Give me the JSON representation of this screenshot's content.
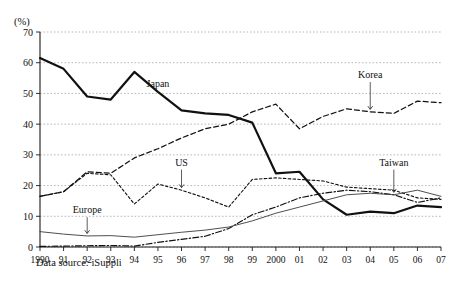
{
  "figure": {
    "unit_label": "(%)",
    "source_note": "Data source: iSuppli"
  },
  "chart_data": {
    "type": "line",
    "title": "",
    "xlabel": "",
    "ylabel": "(%)",
    "ylim": [
      0,
      70
    ],
    "yticks": [
      0,
      10,
      20,
      30,
      40,
      50,
      60,
      70
    ],
    "grid": true,
    "legend_position": "inline-annotations",
    "x": [
      1990,
      1991,
      1992,
      1993,
      1994,
      1995,
      1996,
      1997,
      1998,
      1999,
      2000,
      2001,
      2002,
      2003,
      2004,
      2005,
      2006,
      2007
    ],
    "categories": [
      "1990",
      "91",
      "92",
      "93",
      "94",
      "95",
      "96",
      "97",
      "98",
      "99",
      "2000",
      "01",
      "02",
      "03",
      "04",
      "05",
      "06",
      "07"
    ],
    "series": [
      {
        "name": "Japan",
        "style": "thick-solid",
        "values": [
          61.5,
          58.0,
          49.0,
          48.0,
          57.0,
          50.5,
          44.5,
          43.5,
          43.0,
          40.5,
          24.0,
          24.5,
          15.5,
          10.5,
          11.5,
          11.0,
          13.5,
          13.0
        ]
      },
      {
        "name": "Korea",
        "style": "dashed",
        "values": [
          16.5,
          18.0,
          24.5,
          24.0,
          29.0,
          32.0,
          35.5,
          38.5,
          40.0,
          44.0,
          46.5,
          38.5,
          42.5,
          45.0,
          44.0,
          43.5,
          47.5,
          47.0
        ]
      },
      {
        "name": "US",
        "style": "fine-dashed",
        "values": [
          16.5,
          18.0,
          24.0,
          23.5,
          14.0,
          20.5,
          18.5,
          16.0,
          13.0,
          22.0,
          22.5,
          22.0,
          21.5,
          19.5,
          19.0,
          18.5,
          16.0,
          15.5
        ]
      },
      {
        "name": "Taiwan",
        "style": "dash-dot",
        "values": [
          0.2,
          0.3,
          0.4,
          0.5,
          0.3,
          1.5,
          2.5,
          3.5,
          6.0,
          10.5,
          13.0,
          16.0,
          17.5,
          18.5,
          18.0,
          17.0,
          14.5,
          16.0
        ]
      },
      {
        "name": "Europe",
        "style": "thin-solid",
        "values": [
          5.0,
          4.2,
          3.6,
          3.7,
          3.2,
          4.0,
          4.8,
          5.5,
          6.5,
          8.5,
          11.0,
          13.0,
          15.0,
          17.0,
          17.5,
          17.0,
          18.5,
          16.5
        ]
      }
    ],
    "annotations": [
      {
        "label": "Japan",
        "x_value": 1995,
        "y_value": 52.0
      },
      {
        "label": "Korea",
        "x_value": 2004,
        "y_value": 55.0
      },
      {
        "label": "US",
        "x_value": 1996,
        "y_value": 26.5
      },
      {
        "label": "Taiwan",
        "x_value": 2005,
        "y_value": 26.5
      },
      {
        "label": "Europe",
        "x_value": 1992,
        "y_value": 11.0
      }
    ]
  }
}
